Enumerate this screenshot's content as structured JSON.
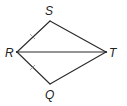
{
  "diagram": {
    "type": "kite / quadrilateral with diagonal",
    "vertices": {
      "S": {
        "label": "S",
        "x": 50,
        "y": 21,
        "label_x": 45,
        "label_y": 15
      },
      "R": {
        "label": "R",
        "x": 17,
        "y": 52,
        "label_x": 6,
        "label_y": 57
      },
      "T": {
        "label": "T",
        "x": 106,
        "y": 52,
        "label_x": 109,
        "label_y": 57
      },
      "Q": {
        "label": "Q",
        "x": 50,
        "y": 84,
        "label_x": 45,
        "label_y": 99
      }
    },
    "segments": [
      {
        "from": "R",
        "to": "S",
        "tick_marks": 1
      },
      {
        "from": "S",
        "to": "T",
        "tick_marks": 0
      },
      {
        "from": "T",
        "to": "Q",
        "tick_marks": 0
      },
      {
        "from": "Q",
        "to": "R",
        "tick_marks": 1
      },
      {
        "from": "R",
        "to": "T",
        "tick_marks": 0
      }
    ],
    "congruence": "RS ≅ RQ",
    "colors": {
      "line": "#2a2a2a",
      "tick": "#8a8a8a",
      "label": "#222222",
      "background": "#ffffff"
    }
  }
}
